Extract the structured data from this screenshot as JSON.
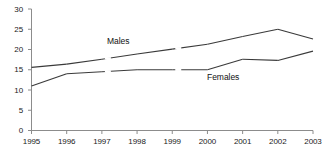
{
  "chart_data": {
    "type": "line",
    "title": "",
    "subtitle": "",
    "xlabel": "",
    "ylabel": "",
    "categories": [
      "1995",
      "1996",
      "1997",
      "1998",
      "1999",
      "2000",
      "2001",
      "2002",
      "2003"
    ],
    "x": [
      1995,
      1996,
      1997,
      1998,
      1999,
      2000,
      2001,
      2002,
      2003
    ],
    "xlim": [
      1995,
      2003
    ],
    "ylim": [
      0,
      30
    ],
    "yticks": [
      0,
      5,
      10,
      15,
      20,
      25,
      30
    ],
    "ytick_labels": [
      "0",
      "5",
      "10",
      "15",
      "20",
      "25",
      "30"
    ],
    "xtick_labels": [
      "1995",
      "1996",
      "1997",
      "1998",
      "1999",
      "2000",
      "2001",
      "2002",
      "2003"
    ],
    "grid": false,
    "legend_position": "inline-annotations",
    "line_color": "#3a3a3a",
    "axis_color": "#8c8c8c",
    "text_color": "#1a1a1a",
    "series": [
      {
        "name": "Males",
        "label": "Males",
        "label_x": 1997.6,
        "label_y": 22.2,
        "values": [
          15.6,
          16.4,
          17.6,
          18.9,
          20.1,
          21.3,
          23.2,
          25.0,
          22.6
        ],
        "breaks_after": [
          1997,
          1999
        ]
      },
      {
        "name": "Females",
        "label": "Females",
        "label_x": 2000.5,
        "label_y": 13.2,
        "values": [
          11.0,
          14.0,
          14.5,
          15.0,
          15.0,
          15.0,
          17.6,
          17.3,
          19.6
        ],
        "breaks_after": [
          1997,
          1999
        ]
      }
    ]
  },
  "annotations": {
    "males_label": "Males",
    "females_label": "Females"
  },
  "axes": {
    "y_axis_name": "value-axis",
    "x_axis_name": "year-axis"
  }
}
